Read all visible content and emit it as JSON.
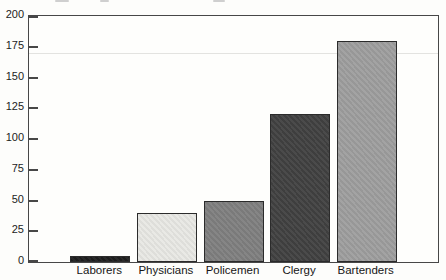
{
  "chart_data": {
    "type": "bar",
    "title": "",
    "xlabel": "",
    "ylabel": "",
    "categories": [
      "Laborers",
      "Physicians",
      "Policemen",
      "Clergy",
      "Bartenders"
    ],
    "values": [
      5,
      40,
      50,
      120,
      180
    ],
    "bar_colors": [
      "#1e1e1e",
      "#e8e8e4",
      "#7f7f7f",
      "#414141",
      "#9e9e9e"
    ],
    "bar_border_color": "#2b2b2b",
    "ylim": [
      0,
      200
    ],
    "yticks": [
      0,
      25,
      50,
      75,
      100,
      125,
      150,
      175,
      200
    ],
    "grid": false,
    "legend": "none",
    "frame_color": "#474747",
    "text_color": "#1c1c1c",
    "background_color": "#fdfdfb"
  }
}
